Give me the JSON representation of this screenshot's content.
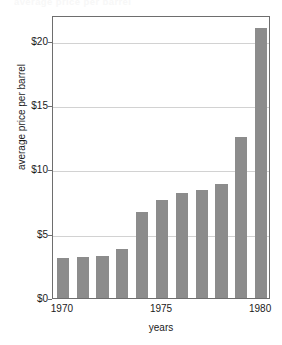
{
  "chart_data": {
    "type": "bar",
    "title": "average price per barrel",
    "xlabel": "years",
    "ylabel": "average price per barrel",
    "categories": [
      "1970",
      "1971",
      "1972",
      "1973",
      "1974",
      "1975",
      "1976",
      "1977",
      "1978",
      "1979",
      "1980"
    ],
    "values": [
      3.1,
      3.2,
      3.3,
      3.8,
      6.7,
      7.6,
      8.2,
      8.4,
      8.9,
      12.5,
      21.0
    ],
    "ylim": [
      0,
      22
    ],
    "y_ticks": [
      0,
      5,
      10,
      15,
      20
    ],
    "y_tick_labels": [
      "$0",
      "$5",
      "$10",
      "$15",
      "$20"
    ],
    "x_tick_labels": [
      "1970",
      "1975",
      "1980"
    ],
    "x_tick_categories": [
      "1970",
      "1975",
      "1980"
    ],
    "grid": true,
    "legend": false,
    "bar_color": "#8c8c8c",
    "grid_color": "#d2d2d2",
    "axis_color": "#6e6e6e"
  }
}
